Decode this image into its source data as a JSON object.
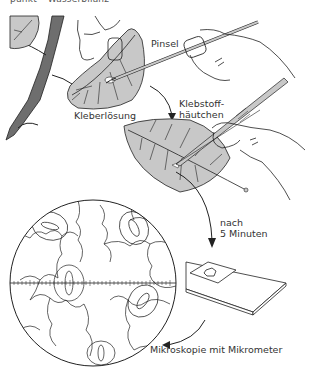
{
  "header": {
    "cut_text": "punkt – Wasserbilanz"
  },
  "labels": {
    "pinsel": "Pinsel",
    "kleberloesung": "Kleberlösung",
    "klebstoff_line1": "Klebstoff-",
    "klebstoff_line2": "häutchen",
    "nach_line1": "nach",
    "nach_line2": "5 Minuten",
    "mikroskopie": "Mikroskopie mit Mikrometer"
  },
  "colors": {
    "leaf_fill": "#c8c8c8",
    "stem_fill": "#6e6e6e",
    "line": "#222222",
    "text": "#333333"
  }
}
